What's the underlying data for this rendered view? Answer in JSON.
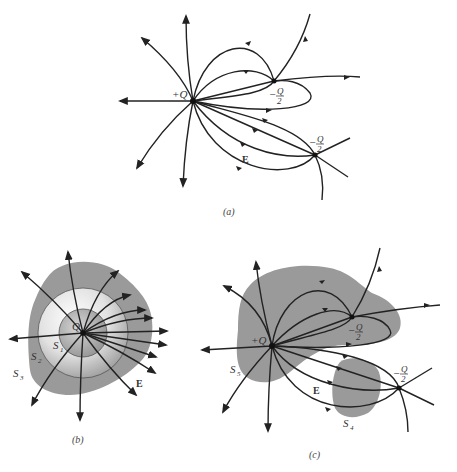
{
  "figure": {
    "panels": [
      {
        "id": "a",
        "caption": "(a)",
        "charges": [
          {
            "label": "+Q",
            "sign": "positive"
          },
          {
            "label": "-Q/2",
            "numerator": "Q",
            "denominator": "2",
            "prefix": "−",
            "sign": "negative"
          },
          {
            "label": "-Q/2",
            "numerator": "Q",
            "denominator": "2",
            "prefix": "−",
            "sign": "negative"
          }
        ],
        "field_label": "E"
      },
      {
        "id": "b",
        "caption": "(b)",
        "charges": [
          {
            "label": "Q",
            "sign": "positive"
          }
        ],
        "surfaces": [
          "S1",
          "S2",
          "S3"
        ],
        "surface_labels": {
          "s1": "S",
          "s1_sub": "1",
          "s2": "S",
          "s2_sub": "2",
          "s3": "S",
          "s3_sub": "3"
        },
        "field_label": "E"
      },
      {
        "id": "c",
        "caption": "(c)",
        "charges": [
          {
            "label": "+Q",
            "sign": "positive"
          },
          {
            "label": "-Q/2",
            "numerator": "Q",
            "denominator": "2",
            "prefix": "−",
            "sign": "negative"
          },
          {
            "label": "-Q/2",
            "numerator": "Q",
            "denominator": "2",
            "prefix": "−",
            "sign": "negative"
          }
        ],
        "surfaces": [
          "S4",
          "S5"
        ],
        "surface_labels": {
          "s4": "S",
          "s4_sub": "4",
          "s5": "S",
          "s5_sub": "5"
        },
        "field_label": "E"
      }
    ]
  },
  "colors": {
    "line": "#222222",
    "surface_fill": "#9a9a9a",
    "background": "#ffffff"
  }
}
